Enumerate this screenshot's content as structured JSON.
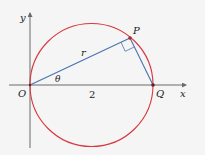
{
  "diagram": {
    "labels": {
      "y_axis": "y",
      "x_axis": "x",
      "origin": "O",
      "point_p": "P",
      "point_q": "Q",
      "radius": "r",
      "angle": "θ",
      "length": "2"
    },
    "colors": {
      "circle": "#d9363e",
      "segments": "#4a72b0",
      "axes": "#6b6b6b",
      "points": "#b0282a",
      "background": "#f4f5f4"
    }
  }
}
